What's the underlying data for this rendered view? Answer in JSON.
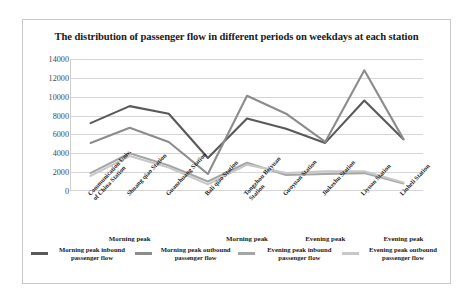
{
  "chart_title": "The distribution of passenger flow in different periods on weekdays at each station",
  "periods": [
    {
      "label": "Morning peak",
      "center_index": 1
    },
    {
      "label": "Morning peak",
      "center_index": 4
    },
    {
      "label": "Evening peak",
      "center_index": 6
    },
    {
      "label": "Evening peak",
      "center_index": 8
    }
  ],
  "legend": [
    {
      "label": "Morning peak inbound passenger flow",
      "color": "#595959"
    },
    {
      "label": "Morning peak outbound passenger flow",
      "color": "#8c8c8c"
    },
    {
      "label": "Evening peak inbound passenger flow",
      "color": "#a6a6a6"
    },
    {
      "label": "Evening peak outbound passenger flow",
      "color": "#c8c8c8"
    }
  ],
  "chart_data": {
    "type": "line",
    "title": "The distribution of passenger flow in different periods on weekdays at each station",
    "xlabel": "",
    "ylabel": "",
    "ylim": [
      0,
      14000
    ],
    "ytick_step": 2000,
    "yticks": [
      14000,
      12000,
      10000,
      8000,
      6000,
      4000,
      2000,
      0
    ],
    "grid": true,
    "legend_position": "bottom",
    "categories": [
      "Communication Univ. of China Station",
      "Shuang qiao Station",
      "Guanzhuang Station",
      "Bali qiao Station",
      "Tongzhou Beiyuan Station",
      "Guoyuan Station",
      "Jiukeshu Station",
      "Liyuan Station",
      "Linheli Station"
    ],
    "series": [
      {
        "name": "Morning peak inbound passenger flow",
        "color": "#595959",
        "values": [
          7200,
          9000,
          8200,
          3500,
          7700,
          6600,
          5100,
          9600,
          5500
        ]
      },
      {
        "name": "Morning peak outbound passenger flow",
        "color": "#8c8c8c",
        "values": [
          5100,
          6700,
          5200,
          1800,
          10100,
          8200,
          5200,
          12800,
          5500
        ]
      },
      {
        "name": "Evening peak inbound passenger flow",
        "color": "#a6a6a6",
        "values": [
          1900,
          4000,
          2700,
          1000,
          3000,
          1700,
          1800,
          1900,
          800
        ]
      },
      {
        "name": "Evening peak outbound passenger flow",
        "color": "#c8c8c8",
        "values": [
          1600,
          3700,
          2500,
          700,
          2800,
          1900,
          2100,
          2100,
          900
        ]
      }
    ]
  }
}
